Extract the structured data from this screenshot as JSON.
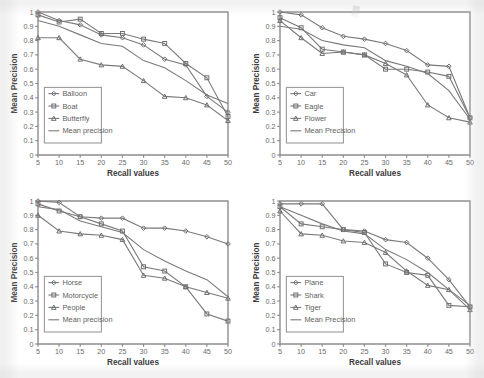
{
  "figure": {
    "panel_count": 4,
    "background": "#ffffff",
    "line_color": "#7a7a7a",
    "axis_color": "#8d8d8d"
  },
  "chart_data": [
    {
      "type": "line",
      "title": "",
      "xlabel": "Recall values",
      "ylabel": "Mean Precision",
      "x": [
        5,
        10,
        15,
        20,
        25,
        30,
        35,
        40,
        45,
        50
      ],
      "xlim": [
        5,
        50
      ],
      "ylim": [
        0,
        1
      ],
      "yticks": [
        0,
        0.1,
        0.2,
        0.3,
        0.4,
        0.5,
        0.6,
        0.7,
        0.8,
        0.9,
        1
      ],
      "xticks": [
        5,
        10,
        15,
        20,
        25,
        30,
        35,
        40,
        45,
        50
      ],
      "grid": false,
      "legend_position": "lower-left",
      "series": [
        {
          "name": "Balloon",
          "marker": "diamond",
          "values": [
            1.0,
            0.94,
            0.91,
            0.84,
            0.82,
            0.77,
            0.67,
            0.63,
            0.41,
            0.3
          ]
        },
        {
          "name": "Boat",
          "marker": "square",
          "values": [
            0.98,
            0.93,
            0.95,
            0.85,
            0.85,
            0.81,
            0.78,
            0.64,
            0.54,
            0.27
          ]
        },
        {
          "name": "Butterfly",
          "marker": "triangle",
          "values": [
            0.82,
            0.82,
            0.67,
            0.63,
            0.62,
            0.52,
            0.41,
            0.4,
            0.35,
            0.24
          ]
        },
        {
          "name": "Mean precision",
          "marker": "none",
          "values": [
            0.94,
            0.9,
            0.84,
            0.78,
            0.76,
            0.66,
            0.61,
            0.52,
            0.42,
            0.36
          ]
        }
      ]
    },
    {
      "type": "line",
      "title": "",
      "xlabel": "Recall values",
      "ylabel": "Mean Precision",
      "x": [
        5,
        10,
        15,
        20,
        25,
        30,
        35,
        40,
        45,
        50
      ],
      "xlim": [
        5,
        50
      ],
      "ylim": [
        0,
        1
      ],
      "yticks": [
        0,
        0.1,
        0.2,
        0.3,
        0.4,
        0.5,
        0.6,
        0.7,
        0.8,
        0.9,
        1
      ],
      "xticks": [
        5,
        10,
        15,
        20,
        25,
        30,
        35,
        40,
        45,
        50
      ],
      "grid": false,
      "legend_position": "lower-left",
      "series": [
        {
          "name": "Car",
          "marker": "diamond",
          "values": [
            1.0,
            0.98,
            0.89,
            0.83,
            0.81,
            0.78,
            0.73,
            0.63,
            0.62,
            0.26
          ]
        },
        {
          "name": "Eagle",
          "marker": "square",
          "values": [
            0.96,
            0.89,
            0.74,
            0.72,
            0.7,
            0.6,
            0.6,
            0.58,
            0.55,
            0.26
          ]
        },
        {
          "name": "Flower",
          "marker": "triangle",
          "values": [
            0.94,
            0.82,
            0.71,
            0.72,
            0.7,
            0.64,
            0.56,
            0.35,
            0.26,
            0.23
          ]
        },
        {
          "name": "Mean Precision",
          "marker": "none",
          "values": [
            0.9,
            0.88,
            0.8,
            0.77,
            0.75,
            0.66,
            0.62,
            0.57,
            0.45,
            0.25
          ]
        }
      ]
    },
    {
      "type": "line",
      "title": "",
      "xlabel": "Recall values",
      "ylabel": "Mean Precision",
      "x": [
        5,
        10,
        15,
        20,
        25,
        30,
        35,
        40,
        45,
        50
      ],
      "xlim": [
        5,
        50
      ],
      "ylim": [
        0,
        1
      ],
      "yticks": [
        0,
        0.1,
        0.2,
        0.3,
        0.4,
        0.5,
        0.6,
        0.7,
        0.8,
        0.9,
        1
      ],
      "xticks": [
        5,
        10,
        15,
        20,
        25,
        30,
        35,
        40,
        45,
        50
      ],
      "grid": false,
      "legend_position": "lower-left",
      "series": [
        {
          "name": "Horse",
          "marker": "diamond",
          "values": [
            1.0,
            0.99,
            0.89,
            0.88,
            0.88,
            0.81,
            0.81,
            0.79,
            0.75,
            0.7
          ]
        },
        {
          "name": "Motorcycle",
          "marker": "square",
          "values": [
            0.98,
            0.93,
            0.89,
            0.84,
            0.79,
            0.54,
            0.51,
            0.4,
            0.21,
            0.16
          ]
        },
        {
          "name": "People",
          "marker": "triangle",
          "values": [
            0.9,
            0.79,
            0.77,
            0.76,
            0.73,
            0.48,
            0.46,
            0.4,
            0.36,
            0.32
          ]
        },
        {
          "name": "Mean precision",
          "marker": "none",
          "values": [
            0.96,
            0.94,
            0.86,
            0.82,
            0.78,
            0.66,
            0.58,
            0.51,
            0.45,
            0.33
          ]
        }
      ]
    },
    {
      "type": "line",
      "title": "",
      "xlabel": "Recall values",
      "ylabel": "Mean Precision",
      "x": [
        5,
        10,
        15,
        20,
        25,
        30,
        35,
        40,
        45,
        50
      ],
      "xlim": [
        5,
        50
      ],
      "ylim": [
        0,
        1
      ],
      "yticks": [
        0,
        0.1,
        0.2,
        0.3,
        0.4,
        0.5,
        0.6,
        0.7,
        0.8,
        0.9,
        1
      ],
      "xticks": [
        5,
        10,
        15,
        20,
        25,
        30,
        35,
        40,
        45,
        50
      ],
      "grid": false,
      "legend_position": "lower-left",
      "series": [
        {
          "name": "Plane",
          "marker": "diamond",
          "values": [
            0.98,
            0.98,
            0.98,
            0.8,
            0.79,
            0.73,
            0.71,
            0.6,
            0.45,
            0.26
          ]
        },
        {
          "name": "Shark",
          "marker": "square",
          "values": [
            0.96,
            0.84,
            0.82,
            0.8,
            0.78,
            0.56,
            0.5,
            0.48,
            0.27,
            0.26
          ]
        },
        {
          "name": "Tiger",
          "marker": "triangle",
          "values": [
            0.93,
            0.77,
            0.76,
            0.72,
            0.71,
            0.64,
            0.51,
            0.41,
            0.38,
            0.24
          ]
        },
        {
          "name": "Mean Precision",
          "marker": "none",
          "values": [
            0.96,
            0.9,
            0.84,
            0.79,
            0.77,
            0.66,
            0.59,
            0.5,
            0.38,
            0.27
          ]
        }
      ]
    }
  ]
}
